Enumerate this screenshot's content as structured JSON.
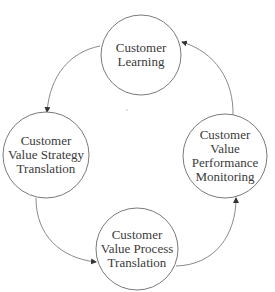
{
  "diagram": {
    "type": "cycle",
    "nodes": [
      {
        "id": "learning",
        "label_lines": [
          "Customer",
          "Learning"
        ],
        "label": "Customer Learning"
      },
      {
        "id": "strategy",
        "label_lines": [
          "Customer",
          "Value Strategy",
          "Translation"
        ],
        "label": "Customer Value Strategy Translation"
      },
      {
        "id": "process",
        "label_lines": [
          "Customer",
          "Value Process",
          "Translation"
        ],
        "label": "Customer Value Process Translation"
      },
      {
        "id": "monitoring",
        "label_lines": [
          "Customer",
          "Value",
          "Performance",
          "Monitoring"
        ],
        "label": "Customer Value Performance Monitoring"
      }
    ],
    "edges": [
      {
        "from": "learning",
        "to": "strategy"
      },
      {
        "from": "strategy",
        "to": "process"
      },
      {
        "from": "process",
        "to": "monitoring"
      },
      {
        "from": "monitoring",
        "to": "learning"
      }
    ],
    "colors": {
      "stroke": "#7a7a7a",
      "text": "#3a3a3a",
      "background": "#ffffff"
    }
  }
}
